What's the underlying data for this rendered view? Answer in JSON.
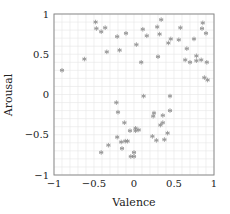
{
  "chart_data": {
    "type": "scatter",
    "title": "",
    "xlabel": "Valence",
    "ylabel": "Arousal",
    "xlim": [
      -1,
      1
    ],
    "ylim": [
      -1,
      1
    ],
    "xticks": [
      -1,
      -0.5,
      0,
      0.5,
      1
    ],
    "yticks": [
      -1,
      -0.5,
      0,
      0.5,
      1
    ],
    "xtick_labels": [
      "−1",
      "−0.5",
      "0",
      "0.5",
      "1"
    ],
    "ytick_labels": [
      "−1",
      "−0.5",
      "0",
      "0.5",
      "1"
    ],
    "grid": true,
    "minor_grid_step": 0.1,
    "legend": null,
    "marker": "asterisk",
    "marker_color": "#888888",
    "series": [
      {
        "name": "samples",
        "points": [
          [
            -0.9,
            0.3
          ],
          [
            -0.62,
            0.44
          ],
          [
            -0.48,
            0.9
          ],
          [
            -0.47,
            0.82
          ],
          [
            -0.41,
            0.78
          ],
          [
            -0.36,
            0.83
          ],
          [
            -0.34,
            0.53
          ],
          [
            -0.18,
            0.55
          ],
          [
            -0.21,
            0.72
          ],
          [
            -0.1,
            0.76
          ],
          [
            0.03,
            0.62
          ],
          [
            0.09,
            0.4
          ],
          [
            0.16,
            0.73
          ],
          [
            0.3,
            0.47
          ],
          [
            0.32,
            0.75
          ],
          [
            0.29,
            0.84
          ],
          [
            0.11,
            0.81
          ],
          [
            0.34,
            0.93
          ],
          [
            0.43,
            0.64
          ],
          [
            0.46,
            0.69
          ],
          [
            0.56,
            0.68
          ],
          [
            0.58,
            0.83
          ],
          [
            0.66,
            0.57
          ],
          [
            0.75,
            0.69
          ],
          [
            0.78,
            0.48
          ],
          [
            0.78,
            0.42
          ],
          [
            0.85,
            0.82
          ],
          [
            0.86,
            0.89
          ],
          [
            0.9,
            0.76
          ],
          [
            0.88,
            0.21
          ],
          [
            0.92,
            0.18
          ],
          [
            0.84,
            0.43
          ],
          [
            0.7,
            0.4
          ],
          [
            0.64,
            0.43
          ],
          [
            0.91,
            0.4
          ],
          [
            -0.22,
            -0.1
          ],
          [
            -0.2,
            -0.22
          ],
          [
            -0.12,
            -0.35
          ],
          [
            -0.05,
            -0.45
          ],
          [
            -0.21,
            -0.53
          ],
          [
            -0.16,
            -0.59
          ],
          [
            -0.11,
            -0.58
          ],
          [
            -0.08,
            -0.58
          ],
          [
            -0.32,
            -0.63
          ],
          [
            -0.41,
            -0.72
          ],
          [
            -0.15,
            -0.67
          ],
          [
            0.02,
            -0.45
          ],
          [
            -0.04,
            -0.77
          ],
          [
            0.06,
            -0.44
          ],
          [
            0.25,
            -0.23
          ],
          [
            0.24,
            -0.27
          ],
          [
            0.36,
            -0.26
          ],
          [
            0.45,
            -0.2
          ],
          [
            0.33,
            -0.38
          ],
          [
            0.36,
            -0.35
          ],
          [
            0.23,
            -0.52
          ],
          [
            0.42,
            -0.48
          ],
          [
            0.38,
            -0.56
          ],
          [
            0.0,
            -0.72
          ],
          [
            0.0,
            -0.77
          ],
          [
            0.45,
            -0.02
          ],
          [
            0.12,
            -0.02
          ],
          [
            0.28,
            -0.57
          ],
          [
            0.02,
            -0.42
          ]
        ]
      }
    ]
  }
}
